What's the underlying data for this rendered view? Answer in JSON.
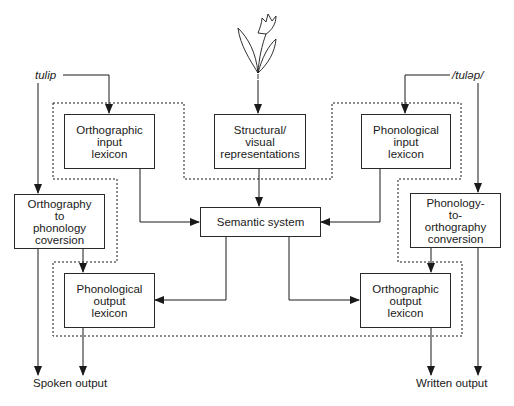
{
  "inputs": {
    "written_word": "tulip",
    "spoken_word": "/tuləp/",
    "picture": "tulip-icon"
  },
  "boxes": {
    "orthographic_input_lexicon": [
      "Orthographic",
      "input",
      "lexicon"
    ],
    "structural_visual": [
      "Structural/",
      "visual",
      "representations"
    ],
    "phonological_input_lexicon": [
      "Phonological",
      "input",
      "lexicon"
    ],
    "semantic_system": [
      "Semantic system"
    ],
    "orthography_to_phonology": [
      "Orthography",
      "to",
      "phonology",
      "coversion"
    ],
    "phonology_to_orthography": [
      "Phonology-",
      "to-",
      "orthography",
      "conversion"
    ],
    "phonological_output_lexicon": [
      "Phonological",
      "output",
      "lexicon"
    ],
    "orthographic_output_lexicon": [
      "Orthographic",
      "output",
      "lexicon"
    ]
  },
  "outputs": {
    "spoken": "Spoken output",
    "written": "Written output"
  }
}
